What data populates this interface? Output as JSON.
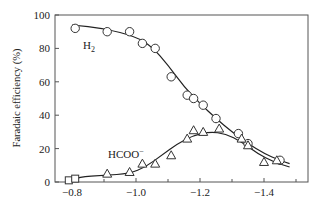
{
  "chart_data": {
    "type": "line",
    "title": "",
    "xlabel": "",
    "ylabel": "Faradaic efficiency (%)",
    "xlim": [
      -0.75,
      -1.54
    ],
    "ylim": [
      0,
      100
    ],
    "x_ticks": [
      -0.8,
      -1.0,
      -1.2,
      -1.4
    ],
    "x_tick_labels": [
      "−0.8",
      "−1.0",
      "−1.2",
      "−1.4"
    ],
    "x_minor_ticks": [
      -0.9,
      -1.1,
      -1.3,
      -1.5
    ],
    "y_ticks": [
      0,
      20,
      40,
      60,
      80,
      100
    ],
    "y_tick_labels": [
      "0",
      "20",
      "40",
      "60",
      "80",
      "100"
    ],
    "grid": false,
    "legend": "inline labels",
    "series": [
      {
        "name": "H2",
        "label_main": "H",
        "label_sub": "2",
        "marker": "circle",
        "points": [
          [
            -0.81,
            92
          ],
          [
            -0.91,
            90
          ],
          [
            -0.98,
            90
          ],
          [
            -1.02,
            83
          ],
          [
            -1.06,
            80
          ],
          [
            -1.11,
            63
          ],
          [
            -1.16,
            52
          ],
          [
            -1.18,
            50
          ],
          [
            -1.21,
            46
          ],
          [
            -1.25,
            38
          ],
          [
            -1.32,
            29
          ],
          [
            -1.35,
            23
          ],
          [
            -1.45,
            13
          ]
        ],
        "fit_curve": [
          [
            -0.8,
            94
          ],
          [
            -0.9,
            92
          ],
          [
            -1.0,
            87
          ],
          [
            -1.05,
            81
          ],
          [
            -1.1,
            70
          ],
          [
            -1.15,
            57
          ],
          [
            -1.2,
            47
          ],
          [
            -1.25,
            38
          ],
          [
            -1.3,
            30
          ],
          [
            -1.35,
            23
          ],
          [
            -1.4,
            17
          ],
          [
            -1.45,
            13
          ],
          [
            -1.48,
            11
          ]
        ]
      },
      {
        "name": "HCOO-",
        "label_main": "HCOO",
        "label_sup": "−",
        "marker": "triangle",
        "points": [
          [
            -0.91,
            5
          ],
          [
            -0.98,
            6
          ],
          [
            -1.02,
            11
          ],
          [
            -1.06,
            11
          ],
          [
            -1.11,
            16
          ],
          [
            -1.16,
            26
          ],
          [
            -1.18,
            31
          ],
          [
            -1.21,
            30
          ],
          [
            -1.26,
            32
          ],
          [
            -1.33,
            26
          ],
          [
            -1.35,
            22
          ],
          [
            -1.4,
            12
          ],
          [
            -1.44,
            13
          ]
        ],
        "fit_curve": [
          [
            -0.79,
            0
          ],
          [
            -0.82,
            3
          ],
          [
            -0.9,
            4
          ],
          [
            -0.98,
            5
          ],
          [
            -1.03,
            9
          ],
          [
            -1.08,
            16
          ],
          [
            -1.13,
            23
          ],
          [
            -1.18,
            28
          ],
          [
            -1.23,
            30
          ],
          [
            -1.28,
            29
          ],
          [
            -1.33,
            24
          ],
          [
            -1.38,
            17
          ],
          [
            -1.43,
            12
          ],
          [
            -1.48,
            9
          ]
        ]
      },
      {
        "name": "CO/other (squares)",
        "marker": "square",
        "points": [
          [
            -0.79,
            1
          ],
          [
            -0.81,
            2
          ]
        ]
      }
    ]
  }
}
